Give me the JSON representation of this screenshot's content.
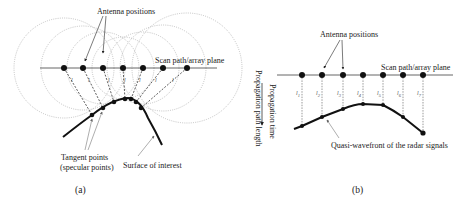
{
  "panel_a": {
    "caption": "(a)",
    "antenna_label": "Antenna positions",
    "scan_label": "Scan path/array plane",
    "tangent_label_line1": "Tangent points",
    "tangent_label_line2": "(specular points)",
    "surface_label": "Surface of interest",
    "antenna_count": 7
  },
  "panel_b": {
    "caption": "(b)",
    "antenna_label": "Antenna positions",
    "scan_label": "Scan path/array plane",
    "axis_label_time": "Propagation time",
    "axis_label_path": "Propagation path length",
    "wavefront_label": "Quasi-wavefront  of the radar signals",
    "distance_labels": [
      "l",
      "l",
      "l",
      "l",
      "l",
      "l",
      "l"
    ],
    "distance_subscripts": [
      "1",
      "2",
      "3",
      "4",
      "5",
      "6",
      "7"
    ]
  },
  "colors": {
    "ink": "#111111",
    "circles": "#aaaaaa",
    "background": "#ffffff"
  }
}
